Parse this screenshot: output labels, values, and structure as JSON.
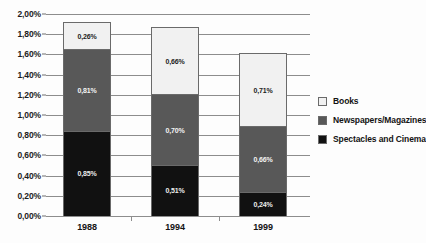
{
  "figure": {
    "title_sliver": "",
    "decimal_separator": ","
  },
  "chart_data": {
    "type": "bar",
    "stacked": true,
    "title": "",
    "xlabel": "",
    "ylabel": "",
    "categories": [
      "1988",
      "1994",
      "1999"
    ],
    "ylim": [
      0,
      2.0
    ],
    "ytick_step": 0.2,
    "ytick_labels": [
      "2,00%",
      "1,80%",
      "1,60%",
      "1,40%",
      "1,20%",
      "1,00%",
      "0,80%",
      "0,60%",
      "0,40%",
      "0,20%",
      "0,00%"
    ],
    "ytick_values": [
      2.0,
      1.8,
      1.6,
      1.4,
      1.2,
      1.0,
      0.8,
      0.6,
      0.4,
      0.2,
      0.0
    ],
    "grid": true,
    "legend_position": "right",
    "series": [
      {
        "name": "Spectacles and Cinema",
        "color": "#111111",
        "values": [
          0.85,
          0.51,
          0.24
        ],
        "labels": [
          "0,85%",
          "0,51%",
          "0,24%"
        ]
      },
      {
        "name": "Newspapers/Magazines",
        "color": "#585858",
        "values": [
          0.81,
          0.7,
          0.66
        ],
        "labels": [
          "0,81%",
          "0,70%",
          "0,66%"
        ]
      },
      {
        "name": "Books",
        "color": "#f1f1f1",
        "values": [
          0.26,
          0.66,
          0.71
        ],
        "labels": [
          "0,26%",
          "0,66%",
          "0,71%"
        ]
      }
    ],
    "totals": [
      1.92,
      1.87,
      1.61
    ]
  },
  "legend": {
    "items": [
      {
        "label": "Books",
        "color": "#f1f1f1"
      },
      {
        "label": "Newspapers/Magazines",
        "color": "#585858"
      },
      {
        "label": "Spectacles and Cinema",
        "color": "#111111"
      }
    ]
  }
}
